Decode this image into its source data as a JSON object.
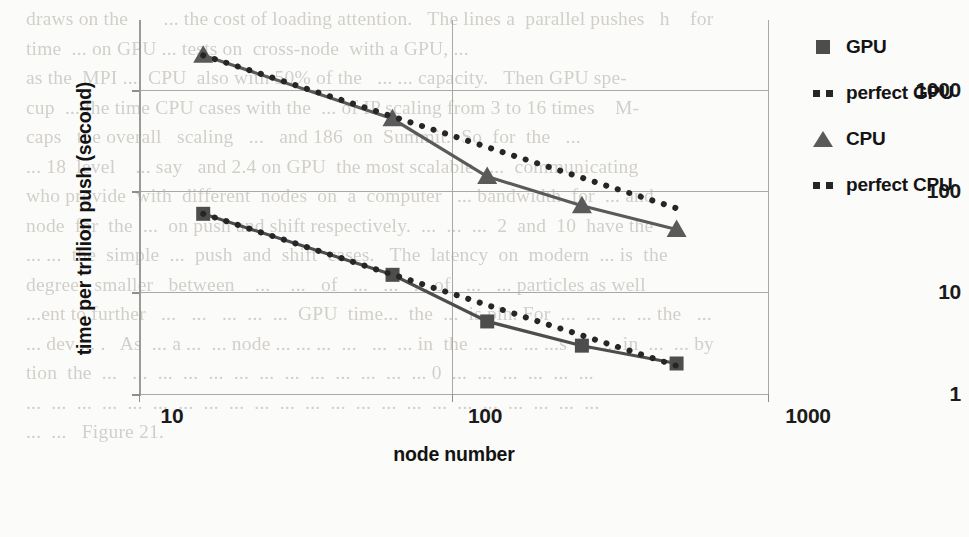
{
  "page": {
    "background_text_top": "draws on the... the cost of loading attention.  The lines are parallel, pushes  h  those for",
    "background_text_lines": [
      "draws on the       ... the cost of loading attention.   The lines a  parallel pushes   h    for",
      "time  ... on GPU ... tests on  cross-node  with a GPU, ...",
      "as the  MPI ...  CPU  also with 50% of the   ... ... capacity.   Then GPU spe-",
      "cup  ... the time CPU cases with the  ... of IP scaling from 3 to 16 times    M-",
      "caps   the overall   scaling   ...   and 186  on  Summit.  So  for  the   ...",
      "... 18  level    ... say   and 2.4 on GPU  the most scalable   ...  communicating",
      "who provide  with  different  nodes  on  a  computer   ... bandwidth  for  ... and",
      "node  for  the  ...  on push and shift respectively.  ...  ...  ...  2  and  10  have the",
      "... ...  the  simple  ...  push  and  shift  cases.   The  latency  on  modern  ... is  the",
      "degree   smaller   between    ...    ...   of   ...   ...   ... of   ...   ... particles as well",
      "...ent to further   ...   ...   ...  ...  ...  GPU  time...  the  ...  is pin. For  ...  ...  ...  ... the   ...",
      "... dev ... .   As  ... a ...  ... node ... ... ...  ...   ...  ... in  the  ... ...  ... ...s  ...  ... in  ...  ... by",
      "tion  the  ...   ...  ...  ...  ...  ...  ...  ...  ...  ...  ...  ...  ... 0  ...  ...  ...  ...  ...  ...",
      "...  ...  ...  ...  ...  ...  ...  ...  ...  ...  ...  ...  ...  ...  ...  ...  ...  ...  ...  ...  ...  ...  ...",
      "...  ...   Figure 21."
    ]
  },
  "chart_data": {
    "type": "line",
    "title": "",
    "xlabel": "node number",
    "ylabel": "time per trillion push (second)",
    "xscale": "log",
    "yscale": "log",
    "xlim": [
      10,
      1000
    ],
    "ylim": [
      1,
      3000
    ],
    "x_ticks": [
      "10",
      "100",
      "1000"
    ],
    "x_tick_values": [
      10,
      100,
      1000
    ],
    "y_ticks": [
      "1",
      "10",
      "100",
      "1000"
    ],
    "y_tick_values": [
      1,
      10,
      100,
      1000
    ],
    "grid": "both",
    "legend_position": "right",
    "series": [
      {
        "name": "GPU",
        "marker": "square",
        "style": "solid",
        "color": "#4d4d4d",
        "x": [
          16,
          64,
          128,
          256,
          512
        ],
        "y": [
          60,
          15,
          5.2,
          3.0,
          2.0
        ]
      },
      {
        "name": "perfect GPU",
        "marker": "none",
        "style": "dotted",
        "color": "#262626",
        "x": [
          16,
          512
        ],
        "y": [
          60,
          1.9
        ]
      },
      {
        "name": "CPU",
        "marker": "triangle",
        "style": "solid",
        "color": "#5a5a5a",
        "x": [
          16,
          64,
          128,
          256,
          512
        ],
        "y": [
          2200,
          520,
          140,
          72,
          42
        ]
      },
      {
        "name": "perfect CPU",
        "marker": "none",
        "style": "dotted",
        "color": "#262626",
        "x": [
          16,
          512
        ],
        "y": [
          2200,
          68
        ]
      }
    ]
  },
  "legend": {
    "items": [
      {
        "label": "GPU",
        "key": "square-marker"
      },
      {
        "label": "perfect GPU",
        "key": "dotted-line"
      },
      {
        "label": "CPU",
        "key": "triangle-marker"
      },
      {
        "label": "perfect CPU",
        "key": "dotted-line"
      }
    ]
  }
}
